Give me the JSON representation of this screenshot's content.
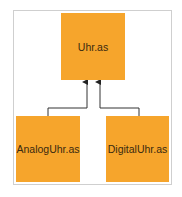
{
  "diagram": {
    "type": "class-inheritance",
    "nodes": [
      {
        "id": "top",
        "label": "Uhr.as"
      },
      {
        "id": "left",
        "label": "AnalogUhr.as"
      },
      {
        "id": "right",
        "label": "DigitalUhr.as"
      }
    ],
    "edges": [
      {
        "from": "left",
        "to": "top",
        "arrow": "arrow-up"
      },
      {
        "from": "right",
        "to": "top",
        "arrow": "arrow-up"
      }
    ],
    "colors": {
      "box": "#f6a52c",
      "line": "#333333",
      "frame": "#cfcfcf"
    }
  }
}
